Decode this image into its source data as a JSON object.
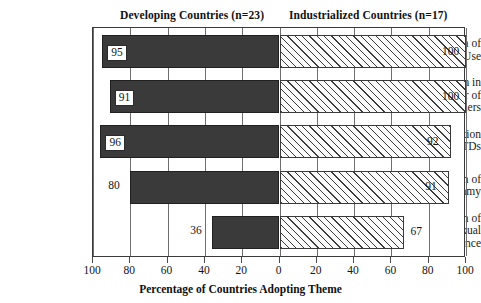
{
  "chart_data": {
    "type": "bar",
    "orientation": "horizontal-diverging",
    "title": "",
    "xlabel": "Percentage of Countries Adopting Theme",
    "ylabel": "",
    "grid": true,
    "legend_position": "top",
    "axis": {
      "left_ticks": [
        100,
        80,
        60,
        40,
        20,
        0
      ],
      "right_ticks": [
        0,
        20,
        40,
        60,
        80,
        100
      ],
      "tick_labels": [
        "100",
        "80",
        "60",
        "40",
        "20",
        "0",
        "20",
        "40",
        "60",
        "80",
        "100"
      ],
      "left_range": [
        0,
        100
      ],
      "right_range": [
        0,
        100
      ]
    },
    "categories": [
      "Promotion of Condom Use",
      "Reduction in Number of Partners",
      "Prevention of STDs",
      "Promotion of Monogamy",
      "Promotion of Sexual Abstinence"
    ],
    "series": [
      {
        "name": "Developing Countries (n=23)",
        "side": "left",
        "values": [
          95,
          91,
          96,
          80,
          36
        ]
      },
      {
        "name": "Industrialized Countries (n=17)",
        "side": "right",
        "values": [
          100,
          100,
          92,
          91,
          67
        ]
      }
    ]
  },
  "headings": {
    "developing": "Developing Countries (n=23)",
    "industrialized": "Industrialized Countries (n=17)"
  },
  "axis_title": "Percentage of Countries Adopting Theme",
  "categories": [
    {
      "lines": [
        "Promotion of",
        "Condom Use"
      ]
    },
    {
      "lines": [
        "Reduction in",
        "Number of",
        "Partners"
      ]
    },
    {
      "lines": [
        "Prevention",
        "of STDs"
      ]
    },
    {
      "lines": [
        "Promotion of",
        "Monogamy"
      ]
    },
    {
      "lines": [
        "Promotion of",
        "Sexual",
        "Abstinence"
      ]
    }
  ],
  "rows": [
    {
      "left_value": "95",
      "right_value": "100",
      "left_label_style": "boxed",
      "right_label_style": "plain"
    },
    {
      "left_value": "91",
      "right_value": "100",
      "left_label_style": "boxed",
      "right_label_style": "plain"
    },
    {
      "left_value": "96",
      "right_value": "92",
      "left_label_style": "boxed",
      "right_label_style": "plain"
    },
    {
      "left_value": "80",
      "right_value": "91",
      "left_label_style": "plain",
      "right_label_style": "plain"
    },
    {
      "left_value": "36",
      "right_value": "67",
      "left_label_style": "plain",
      "right_label_style": "plain"
    }
  ],
  "tick_labels": [
    "100",
    "80",
    "60",
    "40",
    "20",
    "0",
    "20",
    "40",
    "60",
    "80",
    "100"
  ],
  "colors": {
    "left_bar": "#3a3a3a",
    "right_bar_stroke": "#3a3a3a",
    "frame": "#3a3a3a",
    "text": "#1a1a1a"
  }
}
